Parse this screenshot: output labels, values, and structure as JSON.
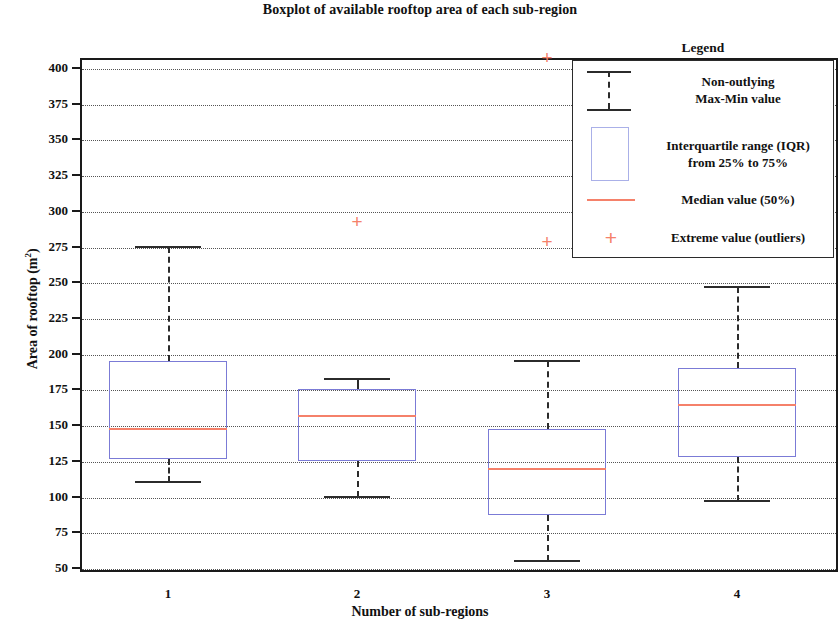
{
  "chart_data": {
    "type": "box",
    "title": "Boxplot of available rooftop area of each sub-region",
    "xlabel": "Number of sub-regions",
    "ylabel": "Area of rooftop (m²)",
    "ylabel_base": "Area of rooftop (m",
    "ylabel_sup": "2",
    "ylabel_tail": ")",
    "ylim": [
      45,
      412
    ],
    "ytick_labels": [
      "400",
      "375",
      "350",
      "325",
      "300",
      "275",
      "250",
      "225",
      "200",
      "175",
      "150",
      "125",
      "100",
      "75",
      "50"
    ],
    "ytick_values": [
      400,
      375,
      350,
      325,
      300,
      275,
      250,
      225,
      200,
      175,
      150,
      125,
      100,
      75,
      50
    ],
    "xtick_labels": [
      "1",
      "2",
      "3",
      "4"
    ],
    "grid": true,
    "legend_position": "top-right",
    "categories": [
      "1",
      "2",
      "3",
      "4"
    ],
    "boxes": [
      {
        "category": "1",
        "whisker_high": 275,
        "q3": 195,
        "median": 148,
        "q1": 126,
        "whisker_low": 110,
        "outliers": []
      },
      {
        "category": "2",
        "whisker_high": 182,
        "q3": 175,
        "median": 157,
        "q1": 125,
        "whisker_low": 100,
        "outliers": [
          293
        ]
      },
      {
        "category": "3",
        "whisker_high": 195,
        "q3": 147,
        "median": 120,
        "q1": 87,
        "whisker_low": 55,
        "outliers": [
          408,
          279
        ]
      },
      {
        "category": "4",
        "whisker_high": 247,
        "q3": 190,
        "median": 165,
        "q1": 128,
        "whisker_low": 97,
        "outliers": []
      }
    ]
  },
  "legend": {
    "title": "Legend",
    "entries": [
      {
        "symbol": "whisker-symbol",
        "label": "Non-outlying\nMax-Min value",
        "line1": "Non-outlying",
        "line2": "Max-Min value"
      },
      {
        "symbol": "box-symbol",
        "label": "Interquartile range (IQR) from 25% to 75%",
        "line1": "Interquartile range (IQR)",
        "line2": "from 25% to 75%"
      },
      {
        "symbol": "median-symbol",
        "label": "Median value (50%)",
        "line1": "Median value (50%)",
        "line2": ""
      },
      {
        "symbol": "outlier-symbol",
        "label": "Extreme value (outliers)",
        "line1": "Extreme value (outliers)",
        "line2": ""
      }
    ]
  },
  "colors": {
    "box_edge": "#7b7bd6",
    "median": "#f5816a",
    "outlier": "#f5816a",
    "whisker": "#2b2b2b",
    "axis": "#1a1a1a",
    "grid": "#555555"
  }
}
